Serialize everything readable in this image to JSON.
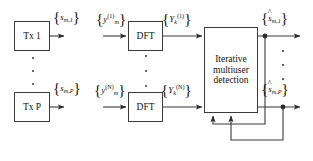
{
  "figure": {
    "type": "block-diagram"
  },
  "blocks": {
    "tx_first": {
      "label": "Tx 1"
    },
    "tx_last": {
      "label": "Tx P"
    },
    "dft_first": {
      "label": "DFT"
    },
    "dft_last": {
      "label": "DFT"
    },
    "detector": {
      "line1": "Iterative",
      "line2": "multiuser",
      "line3": "detection"
    }
  },
  "labels": {
    "tx_first_out": {
      "open": "{",
      "sym": "s",
      "sub": "m,1",
      "sup": "",
      "close": "}"
    },
    "tx_last_out": {
      "open": "{",
      "sym": "s",
      "sub": "m,P",
      "sup": "",
      "close": "}"
    },
    "rx_first_in": {
      "open": "{",
      "sym": "y",
      "sub": "m",
      "sup": "(1)",
      "close": "}"
    },
    "rx_last_in": {
      "open": "{",
      "sym": "y",
      "sub": "m",
      "sup": "(N)",
      "close": "}"
    },
    "dft_first_out": {
      "open": "{",
      "sym": "Y",
      "sub": "k",
      "sup": "(1)",
      "close": "}"
    },
    "dft_last_out": {
      "open": "{",
      "sym": "Y",
      "sub": "k",
      "sup": "(N)",
      "close": "}"
    },
    "est_first": {
      "open": "{",
      "hat": "^",
      "sym": "s",
      "sub": "m,1",
      "close": "}"
    },
    "est_last": {
      "open": "{",
      "hat": "^",
      "sym": "s",
      "sub": "m,P",
      "close": "}"
    }
  },
  "ellipses": {
    "tx_column": "vertical-dots",
    "dft_column": "vertical-dots",
    "output_column": "vertical-dots"
  },
  "colors": {
    "stroke": "#3a3a3a",
    "text": "#111111",
    "background": "#ffffff",
    "dot": "#4a4a4a"
  }
}
